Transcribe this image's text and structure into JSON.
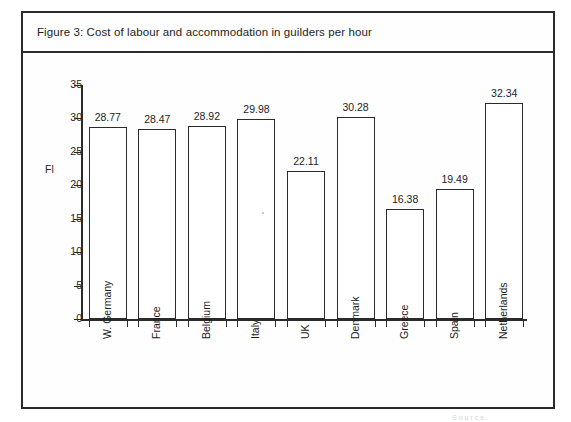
{
  "figure": {
    "title": "Figure 3: Cost of labour and accommodation in guilders per hour"
  },
  "footer": {
    "smudge_text": "Source"
  },
  "chart_data": {
    "type": "bar",
    "title": "Figure 3: Cost of labour and accommodation in guilders per hour",
    "xlabel": "",
    "ylabel": "Fl",
    "ylim": [
      0,
      35
    ],
    "yticks": [
      0,
      5,
      10,
      15,
      20,
      25,
      30,
      35
    ],
    "ytick_labels": [
      "0",
      "5",
      "10",
      "15",
      "20",
      "25",
      "30",
      "35"
    ],
    "grid": false,
    "legend": false,
    "bar_style": {
      "fill": "#ffffff",
      "edge": "#2b2b2b"
    },
    "categories": [
      "W. Germany",
      "France",
      "Belgium",
      "Italy",
      "UK",
      "Denmark",
      "Greece",
      "Spain",
      "Netherlands"
    ],
    "values": [
      28.77,
      28.47,
      28.92,
      29.98,
      22.11,
      30.28,
      16.38,
      19.49,
      32.34
    ],
    "value_labels": [
      "28.77",
      "28.47",
      "28.92",
      "29.98",
      "22.11",
      "30.28",
      "16.38",
      "19.49",
      "32.34"
    ]
  }
}
